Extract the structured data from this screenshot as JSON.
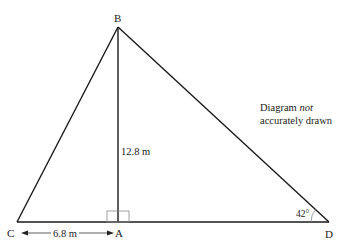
{
  "diagram": {
    "points": {
      "A": {
        "label": "A",
        "x": 118,
        "y": 222
      },
      "B": {
        "label": "B",
        "x": 118,
        "y": 27
      },
      "C": {
        "label": "C",
        "x": 17,
        "y": 222
      },
      "D": {
        "label": "D",
        "x": 329,
        "y": 222
      }
    },
    "measurements": {
      "height_AB": "12.8 m",
      "length_CA": "6.8 m"
    },
    "angle_D": "42°",
    "note": {
      "line1": "Diagram",
      "line1_italic": "not",
      "line2": "accurately drawn"
    },
    "colors": {
      "line": "#1a1a1a",
      "thin_line": "#888888",
      "text": "#222222",
      "background": "#ffffff"
    }
  }
}
